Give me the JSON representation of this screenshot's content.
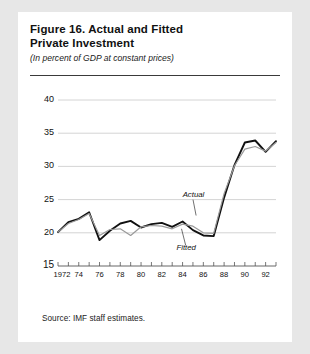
{
  "figure": {
    "title_line1": "Figure 16.  Actual and Fitted",
    "title_line2": "Private Investment",
    "subtitle": "(In percent of GDP at constant prices)",
    "source": "Source:  IMF staff estimates."
  },
  "chart_data": {
    "type": "line",
    "title": "Figure 16. Actual and Fitted Private Investment",
    "subtitle": "(In percent of GDP at constant prices)",
    "xlabel": "",
    "ylabel": "",
    "ylim": [
      15,
      40
    ],
    "xlim": [
      1972,
      1993
    ],
    "yticks": [
      15,
      20,
      25,
      30,
      35,
      40
    ],
    "ytick_labels": [
      "15",
      "20",
      "25",
      "30",
      "35",
      "40"
    ],
    "xticks": [
      1972,
      1973,
      1974,
      1975,
      1976,
      1977,
      1978,
      1979,
      1980,
      1981,
      1982,
      1983,
      1984,
      1985,
      1986,
      1987,
      1988,
      1989,
      1990,
      1991,
      1992,
      1993
    ],
    "xtick_labels": [
      "1972",
      "",
      "74",
      "",
      "76",
      "",
      "78",
      "",
      "80",
      "",
      "82",
      "",
      "84",
      "",
      "86",
      "",
      "88",
      "",
      "90",
      "",
      "92",
      ""
    ],
    "grid": "horizontal",
    "legend": "inline-annotations",
    "annotations": [
      {
        "text": "Actual",
        "x": 1984.2,
        "y": 25.6
      },
      {
        "text": "Fitted",
        "x": 1983.6,
        "y": 17.5
      }
    ],
    "x": [
      1972,
      1973,
      1974,
      1975,
      1976,
      1977,
      1978,
      1979,
      1980,
      1981,
      1982,
      1983,
      1984,
      1985,
      1986,
      1987,
      1988,
      1989,
      1990,
      1991,
      1992,
      1993
    ],
    "series": [
      {
        "name": "Actual",
        "color": "#111111",
        "width": 1.9,
        "values": [
          20.1,
          21.6,
          22.1,
          23.1,
          18.9,
          20.3,
          21.4,
          21.8,
          20.8,
          21.3,
          21.5,
          20.9,
          21.7,
          20.4,
          19.6,
          19.5,
          25.3,
          30.2,
          33.6,
          33.9,
          32.2,
          33.8
        ]
      },
      {
        "name": "Fitted",
        "color": "#9a9a9a",
        "width": 1.2,
        "values": [
          20.1,
          21.4,
          22.0,
          22.9,
          19.6,
          20.5,
          20.6,
          19.6,
          20.9,
          21.1,
          21.0,
          20.6,
          21.3,
          21.0,
          20.0,
          19.9,
          25.9,
          30.1,
          32.6,
          33.0,
          32.3,
          33.6
        ]
      }
    ]
  }
}
